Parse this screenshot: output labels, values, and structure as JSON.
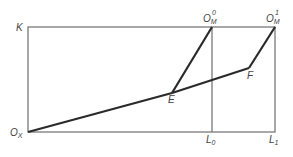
{
  "diagram": {
    "type": "box-diagram",
    "colors": {
      "frame": "#6e6e6e",
      "path": "#2a2a2a",
      "label": "#444444",
      "background": "#ffffff"
    },
    "labels": {
      "K": "K",
      "Ox": {
        "main": "O",
        "sub": "X"
      },
      "OM0": {
        "main": "O",
        "sub": "M",
        "sup": "0"
      },
      "OM1": {
        "main": "O",
        "sub": "M",
        "sup": "1"
      },
      "E": "E",
      "F": "F",
      "L0": {
        "main": "L",
        "sub": "0"
      },
      "L1": {
        "main": "L",
        "sub": "1"
      }
    },
    "points": {
      "Ox": [
        28,
        132
      ],
      "K": [
        28,
        27
      ],
      "OM0": [
        212,
        27
      ],
      "OM1": [
        275,
        27
      ],
      "E": [
        172,
        93
      ],
      "F": [
        249,
        68
      ],
      "L0": [
        212,
        132
      ],
      "L1": [
        275,
        132
      ]
    },
    "segments": [
      {
        "from": "Ox",
        "to": "E",
        "style": "thick"
      },
      {
        "from": "E",
        "to": "F",
        "style": "thick"
      },
      {
        "from": "E",
        "to": "OM0",
        "style": "thick"
      },
      {
        "from": "F",
        "to": "OM1",
        "style": "thick"
      },
      {
        "from": "OM0",
        "to": "L0",
        "style": "thin"
      }
    ]
  }
}
